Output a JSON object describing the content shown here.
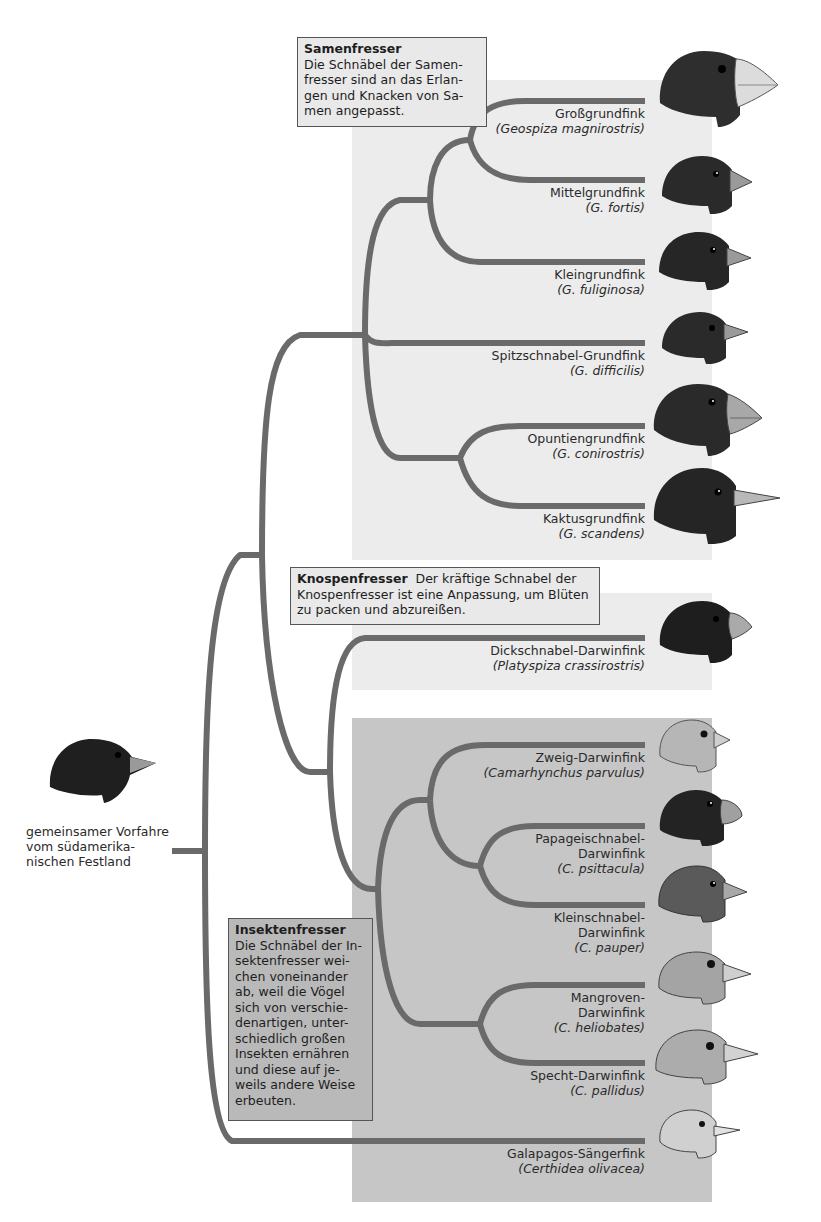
{
  "colors": {
    "branch": "#6a6a6a",
    "panel_seed": "#ececec",
    "panel_bud": "#ececec",
    "panel_insect": "#c6c6c6",
    "callout_light": "#e9e9e9",
    "callout_dark": "#b9b9b9",
    "bird_dark": "#2a2a2a",
    "bird_light": "#b0b0b0",
    "beak": "#cfcfcf"
  },
  "ancestor": {
    "label_lines": [
      "gemeinsamer Vorfahre",
      "vom südamerika-",
      "nischen Festland"
    ]
  },
  "groups": {
    "seed": {
      "title": "Samenfresser",
      "lines": [
        "Die Schnäbel der Samen-",
        "fresser sind an das Erlan-",
        "gen und Knacken von Sa-",
        "men angepasst."
      ]
    },
    "bud": {
      "title": "Knospenfresser",
      "lines": [
        "Der kräftige Schnabel der",
        "Knospenfresser ist eine Anpassung, um Blüten",
        "zu packen und abzureißen."
      ]
    },
    "insect": {
      "title": "Insektenfresser",
      "lines": [
        "Die Schnäbel der In-",
        "sektenfresser wei-",
        "chen voneinander",
        "ab, weil die Vögel",
        "sich von verschie-",
        "denartigen, unter-",
        "schiedlich großen",
        "Insekten ernähren",
        "und diese auf je-",
        "weils andere Weise",
        "erbeuten."
      ]
    }
  },
  "species": [
    {
      "common": [
        "Großgrundfink"
      ],
      "scientific": "(Geospiza magnirostris)",
      "group": "seed",
      "head_tone": "dark",
      "beak": "huge"
    },
    {
      "common": [
        "Mittelgrundfink"
      ],
      "scientific": "(G. fortis)",
      "group": "seed",
      "head_tone": "dark",
      "beak": "medium"
    },
    {
      "common": [
        "Kleingrundfink"
      ],
      "scientific": "(G. fuliginosa)",
      "group": "seed",
      "head_tone": "dark",
      "beak": "small"
    },
    {
      "common": [
        "Spitzschnabel-Grundfink"
      ],
      "scientific": "(G. difficilis)",
      "group": "seed",
      "head_tone": "dark",
      "beak": "pointed"
    },
    {
      "common": [
        "Opuntiengrundfink"
      ],
      "scientific": "(G. conirostris)",
      "group": "seed",
      "head_tone": "dark",
      "beak": "large"
    },
    {
      "common": [
        "Kaktusgrundfink"
      ],
      "scientific": "(G. scandens)",
      "group": "seed",
      "head_tone": "dark",
      "beak": "long"
    },
    {
      "common": [
        "Dickschnabel-Darwinfink"
      ],
      "scientific": "(Platyspiza crassirostris)",
      "group": "bud",
      "head_tone": "dark",
      "beak": "thick"
    },
    {
      "common": [
        "Zweig-Darwinfink"
      ],
      "scientific": "(Camarhynchus parvulus)",
      "group": "insect",
      "head_tone": "light",
      "beak": "small"
    },
    {
      "common": [
        "Papageischnabel-",
        "Darwinfink"
      ],
      "scientific": "(C. psittacula)",
      "group": "insect",
      "head_tone": "dark",
      "beak": "parrot"
    },
    {
      "common": [
        "Kleinschnabel-",
        "Darwinfink"
      ],
      "scientific": "(C. pauper)",
      "group": "insect",
      "head_tone": "mid",
      "beak": "small"
    },
    {
      "common": [
        "Mangroven-",
        "Darwinfink"
      ],
      "scientific": "(C. heliobates)",
      "group": "insect",
      "head_tone": "light",
      "beak": "medium"
    },
    {
      "common": [
        "Specht-Darwinfink"
      ],
      "scientific": "(C. pallidus)",
      "group": "insect",
      "head_tone": "light",
      "beak": "long"
    },
    {
      "common": [
        "Galapagos-Sängerfink"
      ],
      "scientific": "(Certhidea olivacea)",
      "group": "insect",
      "head_tone": "pale",
      "beak": "thin"
    }
  ]
}
